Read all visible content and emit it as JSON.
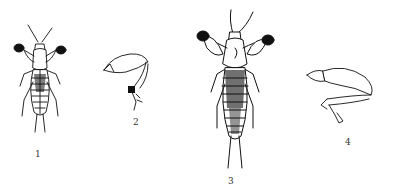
{
  "figures": [
    {
      "id": "1",
      "label": "1",
      "subject": "mole-cricket-whole-body-small"
    },
    {
      "id": "2",
      "label": "2",
      "subject": "foreleg"
    },
    {
      "id": "3",
      "label": "3",
      "subject": "mole-cricket-whole-body-large"
    },
    {
      "id": "4",
      "label": "4",
      "subject": "hind-leg"
    }
  ],
  "colors": {
    "ink": "#111111",
    "paper": "#ffffff",
    "label": "#333333"
  }
}
